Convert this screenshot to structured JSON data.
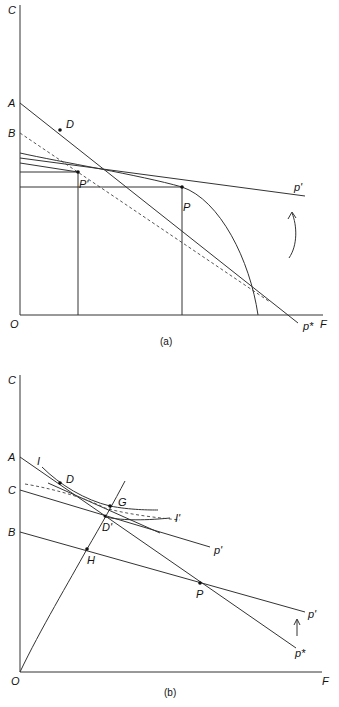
{
  "panel_a": {
    "caption": "(a)",
    "axis_y_label": "C",
    "axis_x_label": "F",
    "origin_label": "O",
    "intercept_labels": {
      "A": "A",
      "B": "B"
    },
    "point_labels": {
      "D": "D",
      "P_prime": "P'",
      "P": "P"
    },
    "line_labels": {
      "p_prime": "p'",
      "p_star": "p*"
    }
  },
  "panel_b": {
    "caption": "(b)",
    "axis_y_label": "C",
    "axis_x_label": "F",
    "origin_label": "O",
    "intercept_labels": {
      "A": "A",
      "C": "C",
      "B": "B"
    },
    "point_labels": {
      "D": "D",
      "G": "G",
      "D_prime": "D'",
      "H": "H",
      "P": "P"
    },
    "curve_labels": {
      "I": "I",
      "I_prime": "I'"
    },
    "line_labels": {
      "p_prime_upper": "p'",
      "p_prime_lower": "p'",
      "p_star": "p*"
    }
  }
}
